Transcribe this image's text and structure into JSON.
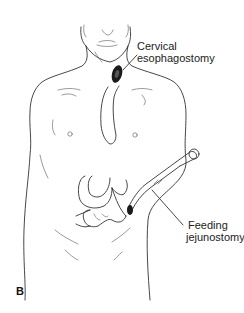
{
  "figure": {
    "panel_letter": "B",
    "annotations": [
      {
        "id": "cervical",
        "lines": [
          "Cervical",
          "esophagostomy"
        ]
      },
      {
        "id": "jejunostomy",
        "lines": [
          "Feeding",
          "jejunostomy"
        ]
      }
    ],
    "colors": {
      "line": "#333333",
      "background": "#ffffff",
      "stoma": "#1a1a1a"
    }
  }
}
